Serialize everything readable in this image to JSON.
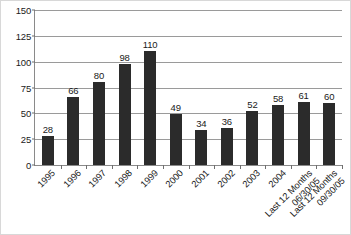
{
  "chart_data": {
    "type": "bar",
    "title": "",
    "subtitle": "",
    "xlabel": "",
    "ylabel": "",
    "ylim": [
      0,
      150
    ],
    "yticks": [
      0,
      25,
      50,
      75,
      100,
      125,
      150
    ],
    "ytick_labels": [
      "0",
      "25",
      "50",
      "75",
      "100",
      "125",
      "150"
    ],
    "grid": "horizontal",
    "legend": "none",
    "bar_color": "#2b2b2b",
    "categories": [
      "1995",
      "1996",
      "1997",
      "1998",
      "1999",
      "2000",
      "2001",
      "2002",
      "2003",
      "2004",
      "Last 12 Months 06/30/05",
      "Last 12 Months 09/30/05"
    ],
    "category_lines": [
      [
        "1995"
      ],
      [
        "1996"
      ],
      [
        "1997"
      ],
      [
        "1998"
      ],
      [
        "1999"
      ],
      [
        "2000"
      ],
      [
        "2001"
      ],
      [
        "2002"
      ],
      [
        "2003"
      ],
      [
        "2004"
      ],
      [
        "Last 12 Months",
        "06/30/05"
      ],
      [
        "Last 12 Months",
        "09/30/05"
      ]
    ],
    "values": [
      28,
      66,
      80,
      98,
      110,
      49,
      34,
      36,
      52,
      58,
      61,
      60
    ],
    "data_labels": [
      "28",
      "66",
      "80",
      "98",
      "110",
      "49",
      "34",
      "36",
      "52",
      "58",
      "61",
      "60"
    ]
  }
}
